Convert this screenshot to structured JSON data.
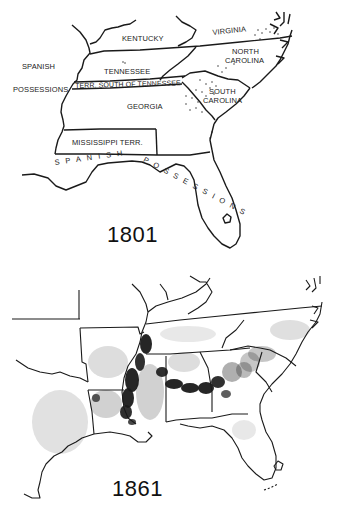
{
  "figure": {
    "maps": [
      {
        "id": "map-1801",
        "year_label": "1801",
        "labels": {
          "kentucky": "KENTUCKY",
          "virginia": "VIRGINIA",
          "north_carolina_1": "NORTH",
          "north_carolina_2": "CAROLINA",
          "spanish_west_1": "SPANISH",
          "spanish_west_2": "POSSESSIONS",
          "tennessee": "TENNESSEE",
          "terr_south": "TERR. SOUTH OF TENNESSEE",
          "south_carolina_1": "SOUTH",
          "south_carolina_2": "CAROLINA",
          "georgia": "GEORGIA",
          "mississippi": "MISSISSIPPI TERR.",
          "spanish_gulf_1": "SPANISH",
          "spanish_gulf_2": "POSSESSIONS"
        }
      },
      {
        "id": "map-1861",
        "year_label": "1861",
        "labels": {}
      }
    ]
  },
  "colors": {
    "ink": "#1a1a1a",
    "background": "#ffffff"
  }
}
